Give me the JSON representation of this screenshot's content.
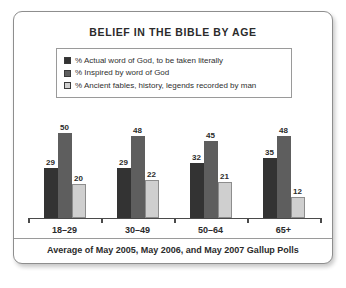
{
  "card": {
    "title": "BELIEF IN THE BIBLE BY AGE",
    "footer_note": "Average of May 2005, May 2006, and May 2007 Gallup Polls"
  },
  "chart_data": {
    "type": "bar",
    "title": "BELIEF IN THE BIBLE BY AGE",
    "subtitle": "Average of May 2005, May 2006, and May 2007 Gallup Polls",
    "xlabel": "",
    "ylabel": "",
    "ylim": [
      0,
      55
    ],
    "grid": false,
    "legend_position": "top",
    "categories": [
      "18–29",
      "30–49",
      "50–64",
      "65+"
    ],
    "series": [
      {
        "name": "% Actual word of God, to be taken literally",
        "color": "#333333",
        "values": [
          29,
          29,
          32,
          35
        ]
      },
      {
        "name": "% Inspired by word of God",
        "color": "#5e5e5e",
        "values": [
          50,
          48,
          45,
          48
        ]
      },
      {
        "name": "% Ancient fables, history, legends recorded by man",
        "color": "#cfcfcf",
        "values": [
          20,
          22,
          21,
          12
        ]
      }
    ]
  }
}
